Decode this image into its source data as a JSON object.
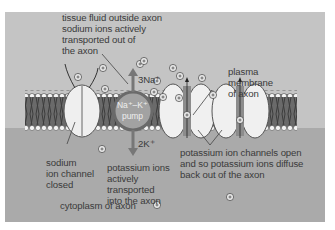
{
  "diagram": {
    "labels": {
      "tissue_fluid": "tissue fluid outside axon",
      "sodium_out_line1": "sodium ions actively",
      "sodium_out_line2": "transported out of",
      "sodium_out_line3": "the axon",
      "plasma_line1": "plasma",
      "plasma_line2": "membrane",
      "plasma_line3": "of axon",
      "na_count": "3Na⁺",
      "k_count": "2K⁺",
      "pump_line1": "Na⁺–K⁺",
      "pump_line2": "pump",
      "sodium_channel_line1": "sodium",
      "sodium_channel_line2": "ion channel",
      "sodium_channel_line3": "closed",
      "k_in_line1": "potassium ions",
      "k_in_line2": "actively",
      "k_in_line3": "transported",
      "k_in_line4": "into the axon",
      "k_channels_line1": "potassium ion channels open",
      "k_channels_line2": "and so potassium ions diffuse",
      "k_channels_line3": "back out of the axon",
      "cytoplasm": "cytoplasm of axon"
    },
    "ion_symbol": "+",
    "colors": {
      "outside_fluid": "#c4c4c4",
      "cytoplasm": "#aaaaaa",
      "membrane_tails": "#444444",
      "phosphate_heads": "#f4f4f4",
      "channel_protein": "#f0f0f0",
      "pump": "#9a9a9a",
      "text": "#3a3a3a"
    }
  }
}
